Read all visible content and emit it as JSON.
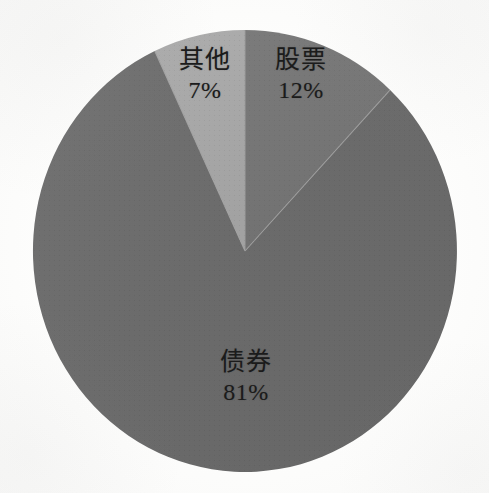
{
  "figure": {
    "kind": "pie-chart",
    "background_color": "#fdfdfc",
    "center_x": 245,
    "center_y": 251,
    "radius_x": 212,
    "radius_y": 221,
    "start_angle_deg": 0,
    "direction": "clockwise",
    "has_border": false,
    "has_legend": false,
    "has_title": false
  },
  "chart_data": {
    "type": "pie",
    "title": "",
    "subtitle": "",
    "xlabel": "",
    "ylabel": "",
    "grid": false,
    "legend_position": "none",
    "labels_inside_slices": true,
    "value_format": "percent",
    "total_percent": 100,
    "categories": [
      "股票",
      "债券",
      "其他"
    ],
    "values": [
      12,
      81,
      7
    ],
    "slices": [
      {
        "label": "股票",
        "label_en": "Stocks",
        "value": 12,
        "value_text": "12%",
        "color": "#757575",
        "start_deg": 0,
        "end_deg": 43.2,
        "label_x": 301,
        "label_y": 46
      },
      {
        "label": "债券",
        "label_en": "Bonds",
        "value": 81,
        "value_text": "81%",
        "color": "#6b6b6b",
        "start_deg": 43.2,
        "end_deg": 334.8,
        "label_x": 246,
        "label_y": 348
      },
      {
        "label": "其他",
        "label_en": "Other",
        "value": 7,
        "value_text": "7%",
        "color": "#a8a8a8",
        "start_deg": 334.8,
        "end_deg": 360,
        "label_x": 205,
        "label_y": 46
      }
    ]
  },
  "colors": {
    "slice_stock": "#757575",
    "slice_bond": "#6b6b6b",
    "slice_other": "#a8a8a8",
    "separator": "#9a9a9a",
    "label_text": "#1b1b1b",
    "page_background": "#fdfdfc"
  }
}
